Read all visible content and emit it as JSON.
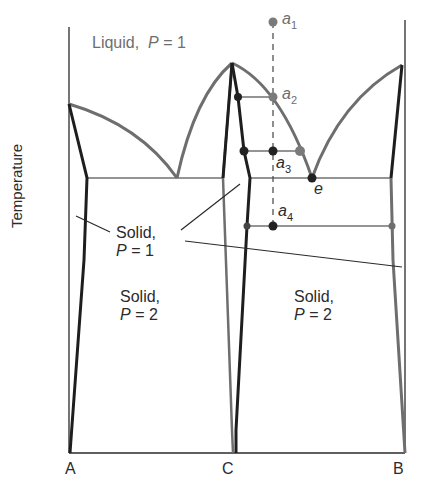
{
  "diagram": {
    "type": "phase-diagram",
    "axis": {
      "ylabel": "Temperature",
      "x_ticks": [
        "A",
        "C",
        "B"
      ]
    },
    "regions": {
      "liquid": {
        "name": "Liquid,",
        "p_label": "P",
        "eq": "=",
        "value": "1"
      },
      "solid_p1": {
        "name": "Solid,",
        "p_label": "P",
        "eq": "=",
        "value": "1"
      },
      "solid_left": {
        "name": "Solid,",
        "p_label": "P",
        "eq": "=",
        "value": "2"
      },
      "solid_right": {
        "name": "Solid,",
        "p_label": "P",
        "eq": "=",
        "value": "2"
      }
    },
    "points": [
      {
        "id": "a1",
        "letter": "a",
        "sub": "1",
        "x": 273,
        "y": 22,
        "color": "#7a7a7a"
      },
      {
        "id": "a2",
        "letter": "a",
        "sub": "2",
        "x": 273,
        "y": 97,
        "color": "#7a7a7a"
      },
      {
        "id": "a3",
        "letter": "a",
        "sub": "3",
        "x": 273,
        "y": 151,
        "color": "#222222"
      },
      {
        "id": "a4",
        "letter": "a",
        "sub": "4",
        "x": 273,
        "y": 226,
        "color": "#222222"
      },
      {
        "id": "e",
        "letter": "e",
        "x": 312,
        "y": 178,
        "color": "#222222"
      }
    ],
    "colors": {
      "liquidus": "#6e6e6e",
      "solidus": "#1e1e1e",
      "thin_line": "#2a2a2a",
      "label_gray": "#6e6e6e",
      "label_dark": "#2b2b2b"
    }
  }
}
